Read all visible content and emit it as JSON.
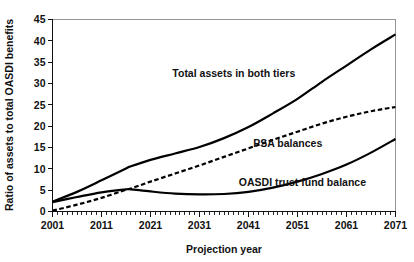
{
  "chart_data": {
    "type": "line",
    "title": "",
    "xlabel": "Projection year",
    "ylabel": "Ratio of assets to total OASDI benefits",
    "xlim": [
      2001,
      2071
    ],
    "ylim": [
      0,
      45
    ],
    "grid": false,
    "legend_position": "inline-annotations",
    "x_ticks": [
      2001,
      2011,
      2021,
      2031,
      2041,
      2051,
      2061,
      2071
    ],
    "x_tick_labels": [
      "2001",
      "2011",
      "2021",
      "2031",
      "2041",
      "2051",
      "2061",
      "2071"
    ],
    "x_minor_tick_interval": 1,
    "y_ticks": [
      0,
      5,
      10,
      15,
      20,
      25,
      30,
      35,
      40,
      45
    ],
    "y_tick_labels": [
      "0",
      "5",
      "10",
      "15",
      "20",
      "25",
      "30",
      "35",
      "40",
      "45"
    ],
    "x": [
      2001,
      2006,
      2011,
      2016,
      2017,
      2021,
      2026,
      2031,
      2036,
      2041,
      2046,
      2051,
      2056,
      2061,
      2066,
      2071
    ],
    "series": [
      {
        "name": "Total assets in both tiers",
        "style": "solid",
        "color": "#000000",
        "label": "Total assets in both tiers",
        "label_x": 2038,
        "label_y": 31.5,
        "values": [
          2.3,
          4.6,
          7.3,
          10.1,
          10.6,
          12.1,
          13.6,
          15.1,
          17.2,
          19.8,
          23.0,
          26.4,
          30.4,
          34.2,
          38.0,
          41.5
        ]
      },
      {
        "name": "PSA balances",
        "style": "dashed",
        "color": "#000000",
        "label": "PSA balances",
        "label_x": 2049,
        "label_y": 15.2,
        "values": [
          0.2,
          1.6,
          3.2,
          5.1,
          5.4,
          7.0,
          8.9,
          10.8,
          12.8,
          14.8,
          16.8,
          18.7,
          20.6,
          22.2,
          23.5,
          24.5
        ]
      },
      {
        "name": "OASDI trust fund balance",
        "style": "solid",
        "color": "#000000",
        "label": "OASDI trust fund balance",
        "label_x": 2052,
        "label_y": 5.9,
        "values": [
          2.2,
          3.4,
          4.5,
          5.2,
          5.2,
          4.7,
          4.2,
          4.0,
          4.1,
          4.6,
          5.6,
          7.0,
          8.8,
          11.0,
          13.8,
          17.0
        ]
      }
    ]
  }
}
